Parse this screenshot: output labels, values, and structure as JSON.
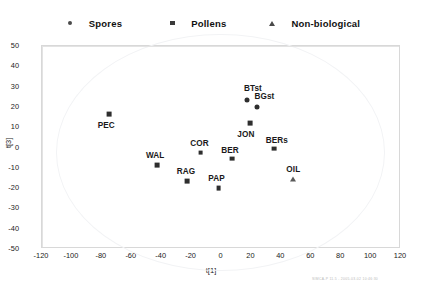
{
  "legend": {
    "items": [
      {
        "label": "Spores",
        "marker": "circle-marker"
      },
      {
        "label": "Pollens",
        "marker": "square-marker"
      },
      {
        "label": "Non-biological",
        "marker": "triangle-marker"
      }
    ]
  },
  "watermark": "SIMCA-P 11.5 - 2005-03-02 10:46:30",
  "chart_data": {
    "type": "scatter",
    "title": "",
    "xlabel": "t[1]",
    "ylabel": "t[3]",
    "xlim": [
      -120,
      120
    ],
    "ylim": [
      -50,
      50
    ],
    "xticks": [
      -120,
      -100,
      -80,
      -60,
      -40,
      -20,
      0,
      20,
      40,
      60,
      80,
      100,
      120
    ],
    "yticks": [
      50,
      40,
      30,
      20,
      10,
      0,
      -10,
      -20,
      -30,
      -40,
      -50
    ],
    "grid": false,
    "zero_lines": true,
    "confidence_ellipse": true,
    "legend_position": "top",
    "series": [
      {
        "name": "Spores",
        "marker": "circle",
        "points": [
          {
            "label": "BTst",
            "x": 17,
            "y": 23.5,
            "label_dx": 6,
            "label_dy": -12
          },
          {
            "label": "BGst",
            "x": 24,
            "y": 20,
            "label_dx": 7,
            "label_dy": -11
          }
        ]
      },
      {
        "name": "Pollens",
        "marker": "square",
        "points": [
          {
            "label": "PEC",
            "x": -75,
            "y": 16.5,
            "label_dx": -3,
            "label_dy": 11
          },
          {
            "label": "JON",
            "x": 19,
            "y": 12,
            "label_dx": -4,
            "label_dy": 11
          },
          {
            "label": "BERs",
            "x": 35,
            "y": -0.5,
            "label_dx": 3,
            "label_dy": -9
          },
          {
            "label": "BER",
            "x": 7,
            "y": -5.5,
            "label_dx": -2,
            "label_dy": -9
          },
          {
            "label": "COR",
            "x": -14,
            "y": -2.5,
            "label_dx": -1,
            "label_dy": -10
          },
          {
            "label": "WAL",
            "x": -43,
            "y": -8.5,
            "label_dx": -2,
            "label_dy": -10
          },
          {
            "label": "RAG",
            "x": -23,
            "y": -16.5,
            "label_dx": -1,
            "label_dy": -10
          },
          {
            "label": "PAP",
            "x": -2,
            "y": -20,
            "label_dx": -2,
            "label_dy": -10
          }
        ]
      },
      {
        "name": "Non-biological",
        "marker": "triangle",
        "points": [
          {
            "label": "OIL",
            "x": 48,
            "y": -15.5,
            "label_dx": 0,
            "label_dy": -10
          }
        ]
      }
    ]
  }
}
